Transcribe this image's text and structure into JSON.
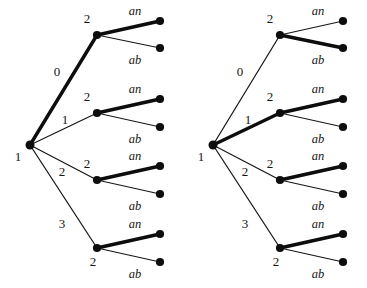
{
  "figure": {
    "title": "",
    "tree_count": 2,
    "colors": {
      "background": "#ffffff",
      "stroke": "#0d0d0d",
      "text": "#141414"
    },
    "leaf_labels": {
      "upper": "an",
      "lower": "ab"
    },
    "root_label": "1",
    "internal_label": "2",
    "root_edge_labels": [
      "0",
      "1",
      "2",
      "3"
    ],
    "trees": [
      {
        "id": "left-tree",
        "root": {
          "label": "1"
        },
        "branches": [
          {
            "edge_label": "0",
            "edge_bold": true,
            "node_label": "2",
            "leaves": [
              {
                "label": "an",
                "bold": true
              },
              {
                "label": "ab",
                "bold": false
              }
            ]
          },
          {
            "edge_label": "1",
            "edge_bold": false,
            "node_label": "2",
            "leaves": [
              {
                "label": "an",
                "bold": true
              },
              {
                "label": "ab",
                "bold": false
              }
            ]
          },
          {
            "edge_label": "2",
            "edge_bold": false,
            "node_label": "2",
            "leaves": [
              {
                "label": "an",
                "bold": true
              },
              {
                "label": "ab",
                "bold": false
              }
            ]
          },
          {
            "edge_label": "3",
            "edge_bold": false,
            "node_label": "2",
            "leaves": [
              {
                "label": "an",
                "bold": true
              },
              {
                "label": "ab",
                "bold": false
              }
            ]
          }
        ]
      },
      {
        "id": "right-tree",
        "root": {
          "label": "1"
        },
        "branches": [
          {
            "edge_label": "0",
            "edge_bold": false,
            "node_label": "2",
            "leaves": [
              {
                "label": "an",
                "bold": false
              },
              {
                "label": "ab",
                "bold": true
              }
            ]
          },
          {
            "edge_label": "1",
            "edge_bold": true,
            "node_label": "2",
            "leaves": [
              {
                "label": "an",
                "bold": true
              },
              {
                "label": "ab",
                "bold": false
              }
            ]
          },
          {
            "edge_label": "2",
            "edge_bold": false,
            "node_label": "2",
            "leaves": [
              {
                "label": "an",
                "bold": true
              },
              {
                "label": "ab",
                "bold": false
              }
            ]
          },
          {
            "edge_label": "3",
            "edge_bold": false,
            "node_label": "2",
            "leaves": [
              {
                "label": "an",
                "bold": true
              },
              {
                "label": "ab",
                "bold": false
              }
            ]
          }
        ]
      }
    ]
  }
}
